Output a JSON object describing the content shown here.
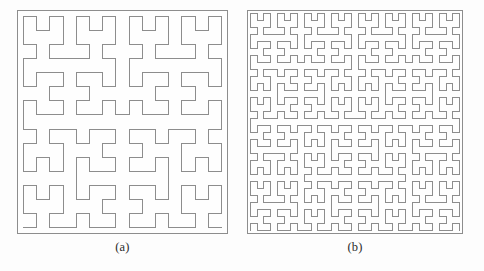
{
  "figure": {
    "background_color": "#fdfdfd",
    "line_color": "#8d8d8d",
    "frame_color": "#8d8d8d",
    "panels": [
      {
        "id": "a",
        "caption": "(a)",
        "curve_name": "Hilbert curve",
        "order": 4,
        "grid": 16,
        "x": 17,
        "y": 10,
        "width": 211,
        "height": 224
      },
      {
        "id": "b",
        "caption": "(b)",
        "curve_name": "Hilbert curve",
        "order": 5,
        "grid": 32,
        "x": 247,
        "y": 10,
        "width": 216,
        "height": 224
      }
    ]
  },
  "chart_data": {
    "type": "line",
    "title": "",
    "subtitle": "",
    "xlabel": "",
    "ylabel": "",
    "grid": false,
    "legend": "none",
    "series": [
      {
        "name": "(a)",
        "curve": "hilbert",
        "order": 4,
        "grid_cells": 16,
        "segments": 255,
        "points": 256,
        "xlim": [
          0,
          15
        ],
        "ylim": [
          0,
          15
        ],
        "start_point": [
          0,
          0
        ],
        "end_point": [
          15,
          0
        ],
        "stroke": "#8d8d8d",
        "stroke_width": 1
      },
      {
        "name": "(b)",
        "curve": "hilbert",
        "order": 5,
        "grid_cells": 32,
        "segments": 1023,
        "points": 1024,
        "xlim": [
          0,
          31
        ],
        "ylim": [
          0,
          31
        ],
        "start_point": [
          0,
          0
        ],
        "end_point": [
          31,
          0
        ],
        "stroke": "#8d8d8d",
        "stroke_width": 1
      }
    ]
  }
}
